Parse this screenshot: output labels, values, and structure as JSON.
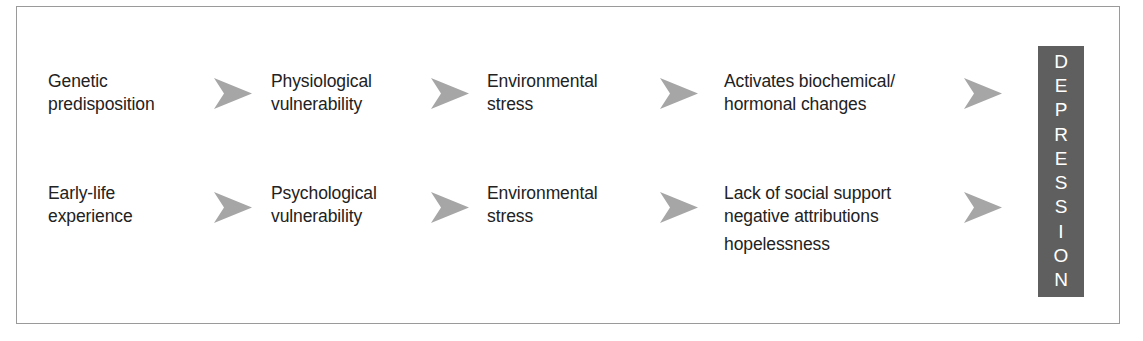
{
  "diagram": {
    "type": "flow",
    "colors": {
      "frame_border": "#9a9a9a",
      "arrow": "#a6a6a6",
      "outcome_bg": "#5f5f5f",
      "outcome_text": "#ffffff",
      "text": "#222222"
    },
    "rows": [
      {
        "id": "biological-pathway",
        "steps": [
          {
            "lines": [
              "Genetic",
              "predisposition"
            ]
          },
          {
            "lines": [
              "Physiological",
              "vulnerability"
            ]
          },
          {
            "lines": [
              "Environmental",
              "stress"
            ]
          },
          {
            "lines": [
              "Activates biochemical/",
              "hormonal changes"
            ]
          }
        ]
      },
      {
        "id": "psychological-pathway",
        "steps": [
          {
            "lines": [
              "Early-life",
              "experience"
            ]
          },
          {
            "lines": [
              "Psychological",
              "vulnerability"
            ]
          },
          {
            "lines": [
              "Environmental",
              "stress"
            ]
          },
          {
            "lines": [
              "Lack of social support",
              "negative attributions",
              "hopelessness"
            ]
          }
        ]
      }
    ],
    "outcome": {
      "label": "DEPRESSION",
      "letters": [
        "D",
        "E",
        "P",
        "R",
        "E",
        "S",
        "S",
        "I",
        "O",
        "N"
      ]
    },
    "arrow_icon": "arrowhead-right-icon"
  }
}
